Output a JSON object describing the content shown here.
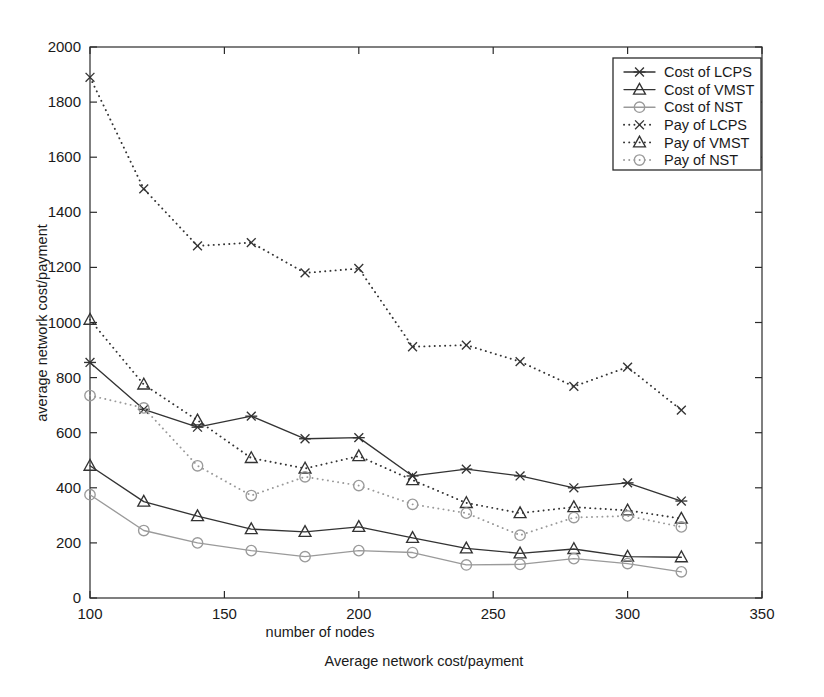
{
  "chart_data": {
    "type": "line",
    "title": "",
    "xlabel": "number of nodes",
    "ylabel": "average network cost/payment",
    "caption": "Average network cost/payment",
    "xlim": [
      100,
      350
    ],
    "ylim": [
      0,
      2000
    ],
    "xticks": [
      100,
      150,
      200,
      250,
      300,
      350
    ],
    "xticklabels": [
      "100",
      "150",
      "200",
      "250",
      "300",
      "350"
    ],
    "yticks": [
      0,
      200,
      400,
      600,
      800,
      1000,
      1200,
      1400,
      1600,
      1800,
      2000
    ],
    "yticklabels": [
      "0",
      "200",
      "400",
      "600",
      "800",
      "1000",
      "1200",
      "1400",
      "1600",
      "1800",
      "2000"
    ],
    "grid": false,
    "legend_position": "upper right",
    "x": [
      100,
      120,
      140,
      160,
      180,
      200,
      220,
      240,
      260,
      280,
      300,
      320
    ],
    "series": [
      {
        "name": "Cost of LCPS",
        "marker": "x-bar",
        "linestyle": "solid",
        "color": "#333333",
        "values": [
          855,
          685,
          620,
          660,
          578,
          582,
          443,
          468,
          443,
          400,
          418,
          352
        ]
      },
      {
        "name": "Cost of VMST",
        "marker": "triangle",
        "linestyle": "solid",
        "color": "#333333",
        "values": [
          480,
          350,
          297,
          250,
          240,
          258,
          218,
          180,
          162,
          178,
          150,
          148
        ]
      },
      {
        "name": "Cost of NST",
        "marker": "circle",
        "linestyle": "solid",
        "color": "#9a9a9a",
        "values": [
          375,
          245,
          200,
          172,
          150,
          172,
          165,
          120,
          122,
          143,
          125,
          95
        ]
      },
      {
        "name": "Pay of LCPS",
        "marker": "x",
        "linestyle": "dotted",
        "color": "#333333",
        "values": [
          1890,
          1485,
          1278,
          1290,
          1180,
          1196,
          912,
          918,
          858,
          768,
          838,
          682
        ]
      },
      {
        "name": "Pay of VMST",
        "marker": "triangle",
        "linestyle": "dotted",
        "color": "#333333",
        "values": [
          1010,
          775,
          645,
          508,
          470,
          515,
          428,
          345,
          308,
          330,
          318,
          288
        ]
      },
      {
        "name": "Pay of NST",
        "marker": "circle",
        "linestyle": "dotted",
        "color": "#9a9a9a",
        "values": [
          735,
          690,
          480,
          372,
          440,
          408,
          340,
          308,
          228,
          292,
          298,
          258
        ]
      }
    ],
    "legend_entries": [
      {
        "label": "Cost of LCPS",
        "marker": "x-bar",
        "linestyle": "solid",
        "color": "#333333"
      },
      {
        "label": "Cost of VMST",
        "marker": "triangle",
        "linestyle": "solid",
        "color": "#333333"
      },
      {
        "label": "Cost of NST",
        "marker": "circle",
        "linestyle": "solid",
        "color": "#9a9a9a"
      },
      {
        "label": "Pay of LCPS",
        "marker": "x",
        "linestyle": "dotted",
        "color": "#333333"
      },
      {
        "label": "Pay of VMST",
        "marker": "triangle",
        "linestyle": "dotted",
        "color": "#333333"
      },
      {
        "label": "Pay of NST",
        "marker": "circle",
        "linestyle": "dotted",
        "color": "#9a9a9a"
      }
    ]
  }
}
